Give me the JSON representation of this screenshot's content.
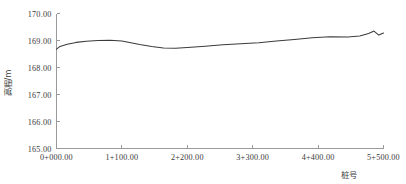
{
  "chart_data": {
    "type": "line",
    "title": "",
    "xlabel": "桩号",
    "ylabel": "高程/m",
    "grid": false,
    "legend": false,
    "ylim": [
      165.0,
      170.0
    ],
    "xlim": [
      0,
      5500
    ],
    "y_ticks": [
      "165.00",
      "166.00",
      "167.00",
      "168.00",
      "169.00",
      "170.00"
    ],
    "y_tick_values": [
      165.0,
      166.0,
      167.0,
      168.0,
      169.0,
      170.0
    ],
    "x_ticks": [
      "0+000.00",
      "1+100.00",
      "2+200.00",
      "3+300.00",
      "4+400.00",
      "5+500.00"
    ],
    "x_tick_values": [
      0,
      1100,
      2200,
      3300,
      4400,
      5500
    ],
    "series": [
      {
        "name": "高程",
        "x": [
          0,
          60,
          180,
          330,
          500,
          700,
          900,
          1100,
          1250,
          1400,
          1600,
          1800,
          2000,
          2200,
          2500,
          2800,
          3100,
          3400,
          3700,
          4000,
          4300,
          4600,
          4900,
          5100,
          5250,
          5340,
          5420,
          5500
        ],
        "values": [
          168.68,
          168.78,
          168.86,
          168.93,
          168.97,
          169.0,
          169.01,
          168.98,
          168.92,
          168.85,
          168.78,
          168.72,
          168.71,
          168.74,
          168.79,
          168.84,
          168.88,
          168.92,
          168.98,
          169.04,
          169.1,
          169.14,
          169.13,
          169.17,
          169.26,
          169.35,
          169.2,
          169.28
        ]
      }
    ]
  },
  "axis_labels": {
    "y_title": "高程/m",
    "x_title": "桩号"
  },
  "colors": {
    "line": "#3b3b3b",
    "axis": "#9a9a9a",
    "text": "#3a3a3a",
    "background": "#ffffff"
  }
}
